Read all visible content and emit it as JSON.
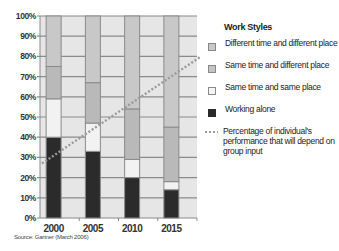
{
  "chart_data": {
    "type": "bar",
    "stacked": true,
    "title": "",
    "xlabel": "",
    "ylabel": "",
    "ylim": [
      0,
      100
    ],
    "y_ticks": [
      "0%",
      "10%",
      "20%",
      "30%",
      "40%",
      "50%",
      "60%",
      "70%",
      "80%",
      "90%",
      "100%"
    ],
    "categories": [
      "2000",
      "2005",
      "2010",
      "2015"
    ],
    "series": [
      {
        "name": "Working alone",
        "color": "#2b2b2b",
        "values": [
          40,
          33,
          20,
          14
        ]
      },
      {
        "name": "Same time and same place",
        "color": "#f2f2f2",
        "values": [
          19,
          14,
          9,
          4
        ]
      },
      {
        "name": "Same time and different place",
        "color": "#b9b9b9",
        "values": [
          16,
          20,
          25,
          27
        ]
      },
      {
        "name": "Different time and different place",
        "color": "#c8c8c8",
        "values": [
          25,
          33,
          46,
          55
        ]
      }
    ],
    "line_series": {
      "name": "Percentage of individual's performance that will depend on group input",
      "style": "dotted",
      "color": "#9a9a9a",
      "start_value": 27,
      "end_value": 80
    },
    "grid": true,
    "legend_position": "right",
    "legend_title": "Work Styles",
    "source": "Source: Gartner (March 2006)"
  },
  "legend": {
    "title": "Work Styles",
    "items": [
      {
        "label": "Different time and different place",
        "color": "#c8c8c8"
      },
      {
        "label": "Same time and different place",
        "color": "#c4c4c4"
      },
      {
        "label": "Same time and same place",
        "color": "#f4f4f4"
      },
      {
        "label": "Working alone",
        "color": "#2b2b2b"
      },
      {
        "label": "Percentage of individual's performance that will depend on group input",
        "color": "#9a9a9a"
      }
    ]
  },
  "source": "Source: Gartner (March 2006)"
}
